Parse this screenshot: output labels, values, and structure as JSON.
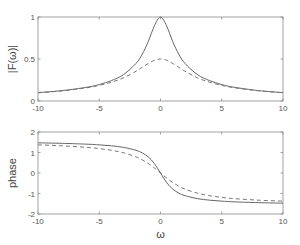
{
  "chart_data": [
    {
      "type": "line",
      "title": "",
      "xlabel": "",
      "ylabel": "|F(ω)|",
      "xlim": [
        -10,
        10
      ],
      "ylim": [
        0,
        1
      ],
      "xticks": [
        -10,
        -5,
        0,
        5,
        10
      ],
      "yticks": [
        0,
        0.5,
        1
      ],
      "xtick_labels": [
        "-10",
        "-5",
        "0",
        "5",
        "10"
      ],
      "ytick_labels": [
        "0",
        "0.5",
        "1"
      ],
      "grid": false,
      "legend": null,
      "x": [
        -10,
        -8,
        -6,
        -5,
        -4,
        -3,
        -2,
        -1.5,
        -1,
        -0.5,
        0,
        0.5,
        1,
        1.5,
        2,
        3,
        4,
        5,
        6,
        8,
        10
      ],
      "series": [
        {
          "name": "solid",
          "style": "solid",
          "values": [
            0.1,
            0.124,
            0.164,
            0.196,
            0.243,
            0.316,
            0.447,
            0.555,
            0.707,
            0.894,
            1.0,
            0.894,
            0.707,
            0.555,
            0.447,
            0.316,
            0.243,
            0.196,
            0.164,
            0.124,
            0.1
          ]
        },
        {
          "name": "dashed",
          "style": "dashed",
          "values": [
            0.098,
            0.121,
            0.158,
            0.186,
            0.224,
            0.277,
            0.354,
            0.4,
            0.447,
            0.485,
            0.5,
            0.485,
            0.447,
            0.4,
            0.354,
            0.277,
            0.224,
            0.186,
            0.158,
            0.121,
            0.098
          ]
        }
      ]
    },
    {
      "type": "line",
      "title": "",
      "xlabel": "ω",
      "ylabel": "phase",
      "xlim": [
        -10,
        10
      ],
      "ylim": [
        -2,
        2
      ],
      "xticks": [
        -10,
        -5,
        0,
        5,
        10
      ],
      "yticks": [
        -2,
        -1,
        0,
        1,
        2
      ],
      "xtick_labels": [
        "-10",
        "-5",
        "0",
        "5",
        "10"
      ],
      "ytick_labels": [
        "-2",
        "-1",
        "0",
        "1",
        "2"
      ],
      "grid": false,
      "legend": null,
      "x": [
        -10,
        -8,
        -6,
        -5,
        -4,
        -3,
        -2,
        -1.5,
        -1,
        -0.5,
        0,
        0.5,
        1,
        1.5,
        2,
        3,
        4,
        5,
        6,
        8,
        10
      ],
      "series": [
        {
          "name": "solid",
          "style": "solid",
          "values": [
            1.471,
            1.446,
            1.406,
            1.373,
            1.326,
            1.249,
            1.107,
            0.983,
            0.785,
            0.464,
            0,
            -0.464,
            -0.785,
            -0.983,
            -1.107,
            -1.249,
            -1.326,
            -1.373,
            -1.406,
            -1.446,
            -1.471
          ]
        },
        {
          "name": "dashed",
          "style": "dashed",
          "values": [
            1.373,
            1.326,
            1.249,
            1.19,
            1.107,
            0.983,
            0.785,
            0.644,
            0.464,
            0.245,
            0,
            -0.245,
            -0.464,
            -0.644,
            -0.785,
            -0.983,
            -1.107,
            -1.19,
            -1.249,
            -1.326,
            -1.373
          ]
        }
      ]
    }
  ]
}
